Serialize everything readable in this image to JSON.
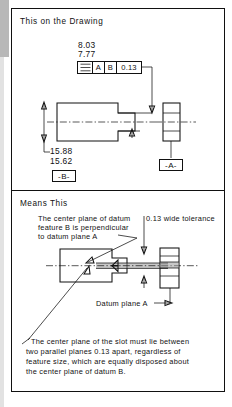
{
  "figure": {
    "type": "gd-and-t-symmetry-illustration",
    "panels": [
      {
        "id": "drawing",
        "title": "This on the Drawing",
        "dimensions": {
          "slot_width_max": "8.03",
          "slot_width_min": "7.77",
          "part_height_max": "15.88",
          "part_height_min": "15.62"
        },
        "feature_control_frame": {
          "symbol_name": "symmetry-symbol",
          "symbol_glyph": "≡",
          "tolerance": "0.13",
          "datums": [
            "A",
            "B"
          ],
          "cells": [
            "symmetry-symbol",
            "A",
            "B",
            "0.13"
          ]
        },
        "datum_labels": [
          {
            "name": "datum-a",
            "text": "-A-"
          },
          {
            "name": "datum-b",
            "text": "-B-"
          }
        ]
      },
      {
        "id": "means",
        "title": "Means This",
        "annotations": [
          {
            "name": "perpendicularity-note",
            "lines": [
              "The center plane of datum",
              "feature B is perpendicular",
              "to datum plane A"
            ]
          },
          {
            "name": "tolerance-zone-note",
            "text": "0.13 wide tolerance"
          },
          {
            "name": "datum-plane-a-label",
            "text": "Datum plane A"
          },
          {
            "name": "slot-center-plane-note",
            "lines": [
              "The center plane of the slot must lie between",
              "two parallel planes 0.13 apart, regardless of",
              "feature size, which are equally disposed about",
              "the center plane of datum B."
            ]
          }
        ]
      }
    ],
    "colors": {
      "ink": "#111111",
      "paper": "#ffffff",
      "tolerance_zone_fill": "#9a9a9a",
      "scan_edge": "#b8b8b8"
    }
  }
}
